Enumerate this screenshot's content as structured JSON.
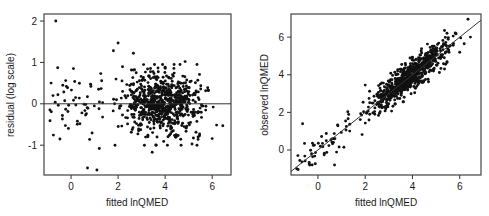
{
  "chart_data": [
    {
      "type": "scatter",
      "title": "",
      "xlabel": "fitted lnQMED",
      "ylabel": "residual (log scale)",
      "xlim": [
        -1.15,
        6.8
      ],
      "ylim": [
        -1.72,
        2.17
      ],
      "xticks": [
        0,
        2,
        4,
        6
      ],
      "yticks": [
        -1,
        0,
        1,
        2
      ],
      "grid": false,
      "legend": null,
      "reference_line": {
        "type": "horizontal",
        "y": 0
      },
      "n_points_approx": 800,
      "notable_points": [
        {
          "x": -0.65,
          "y": 2.0
        },
        {
          "x": -0.85,
          "y": 0.5
        },
        {
          "x": -0.9,
          "y": -0.15
        },
        {
          "x": -0.35,
          "y": 0.45
        },
        {
          "x": 0.1,
          "y": 0.85
        },
        {
          "x": 0.7,
          "y": -1.55
        },
        {
          "x": 1.1,
          "y": -1.6
        },
        {
          "x": 1.2,
          "y": -1.08
        },
        {
          "x": 2.0,
          "y": 1.47
        },
        {
          "x": 1.8,
          "y": 1.28
        },
        {
          "x": 2.65,
          "y": 1.22
        },
        {
          "x": 3.45,
          "y": -1.17
        },
        {
          "x": 6.45,
          "y": -0.53
        },
        {
          "x": 6.0,
          "y": -0.84
        },
        {
          "x": 5.4,
          "y": -0.86
        },
        {
          "x": 4.85,
          "y": 1.02
        }
      ],
      "description": "Residuals vs fitted values; dense cloud between fitted 1.5 and 6.2 centered near 0 with spread roughly -1 to 1."
    },
    {
      "type": "scatter",
      "title": "",
      "xlabel": "fitted lnQMED",
      "ylabel": "observed lnQMED",
      "xlim": [
        -1.14,
        6.9
      ],
      "ylim": [
        -1.33,
        7.23
      ],
      "xticks": [
        0,
        2,
        4,
        6
      ],
      "yticks": [
        0,
        2,
        4,
        6
      ],
      "grid": false,
      "legend": null,
      "reference_line": {
        "type": "identity",
        "slope": 1,
        "intercept": 0
      },
      "n_points_approx": 800,
      "notable_points": [
        {
          "x": -0.65,
          "y": 1.4
        },
        {
          "x": -0.9,
          "y": -1.0
        },
        {
          "x": -0.85,
          "y": -0.3
        },
        {
          "x": 0.7,
          "y": -0.8
        },
        {
          "x": -0.35,
          "y": -0.8
        },
        {
          "x": 1.1,
          "y": 0.15
        },
        {
          "x": 2.0,
          "y": 3.45
        },
        {
          "x": 6.0,
          "y": 5.2
        },
        {
          "x": 6.45,
          "y": 6.0
        },
        {
          "x": 6.35,
          "y": 6.95
        }
      ],
      "description": "Observed vs fitted lnQMED; points tightly clustered along 1:1 line from about -1 to 6.5."
    }
  ],
  "panels": {
    "left": {
      "xlabel": "fitted lnQMED",
      "ylabel": "residual (log scale)",
      "xtick_labels": [
        "0",
        "2",
        "4",
        "6"
      ],
      "ytick_labels": [
        "-1",
        "0",
        "1",
        "2"
      ]
    },
    "right": {
      "xlabel": "fitted lnQMED",
      "ylabel": "observed lnQMED",
      "xtick_labels": [
        "0",
        "2",
        "4",
        "6"
      ],
      "ytick_labels": [
        "0",
        "2",
        "4",
        "6"
      ]
    }
  },
  "colors": {
    "points": "#111111",
    "axes": "#333333",
    "frame": "#444444",
    "background": "#ffffff"
  }
}
